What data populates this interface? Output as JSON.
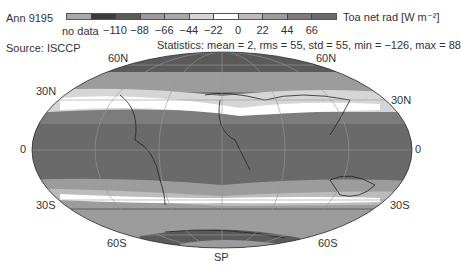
{
  "header": {
    "title": "Ann 9195",
    "source": "Source: ISCCP",
    "colorbar_label": "Toa net rad [W m⁻²]",
    "statistics": "Statistics:  mean = 2, rms = 55, std = 55, min = −126, max = 88"
  },
  "colorbar": {
    "no_data_label": "no data",
    "ticks": [
      "−110",
      "−88",
      "−66",
      "−44",
      "−22",
      "0",
      "22",
      "44",
      "66"
    ],
    "colors": [
      "#a9a9a9",
      "#3c3c3c",
      "#5a5a5a",
      "#9a9a9a",
      "#a8a8a8",
      "#d6d6d6",
      "#ffffff",
      "#bcbcbc",
      "#9c9c9c",
      "#7c7c7c",
      "#6a6a6a"
    ]
  },
  "map_labels": {
    "lat_60n_left": "60N",
    "lat_60n_right": "60N",
    "lat_30n_left": "30N",
    "lat_30n_right": "30N",
    "eq_left": "0",
    "eq_right": "0",
    "lat_30s_left": "30S",
    "lat_30s_right": "30S",
    "lat_60s_left": "60S",
    "lat_60s_right": "60S",
    "south_pole": "SP"
  },
  "chart_data": {
    "type": "heatmap",
    "title": "Ann 9195",
    "subtitle": "Source: ISCCP",
    "variable": "Toa net rad [W m^-2]",
    "projection": "Hammer/Aitoff (elliptical world map)",
    "colorbar_bins": [
      {
        "range": "no data"
      },
      {
        "range": "< -110"
      },
      {
        "range": "-110 to -88"
      },
      {
        "range": "-88 to -66"
      },
      {
        "range": "-66 to -44"
      },
      {
        "range": "-44 to -22"
      },
      {
        "range": "-22 to 0"
      },
      {
        "range": "0 to 22"
      },
      {
        "range": "22 to 44"
      },
      {
        "range": "44 to 66"
      },
      {
        "range": "> 66"
      }
    ],
    "statistics": {
      "mean": 2,
      "rms": 55,
      "std": 55,
      "min": -126,
      "max": 88
    },
    "lat_labels": [
      "60N",
      "30N",
      "0",
      "30S",
      "60S",
      "SP"
    ],
    "grid": true
  }
}
